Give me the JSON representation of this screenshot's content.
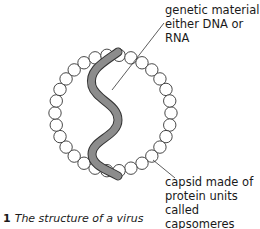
{
  "diagram": {
    "title": "The structure of a virus",
    "figure_number": "1",
    "labels": {
      "genetic_material": [
        "genetic material",
        "either DNA or RNA"
      ],
      "capsid": [
        "capsid made of",
        "protein units called",
        "capsomeres"
      ]
    },
    "capsomere_count": 30,
    "colors": {
      "strand": "#8c8c8c",
      "outline": "#333333"
    }
  }
}
